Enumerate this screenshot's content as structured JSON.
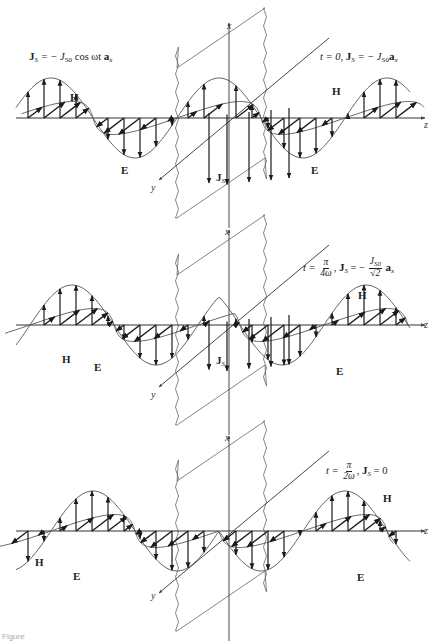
{
  "figure": {
    "colors": {
      "ink": "#1a1a1a",
      "envelope": "#555555",
      "sheet": "#666666",
      "background": "#ffffff"
    },
    "panels": [
      {
        "id": "t0",
        "axis_y": 118,
        "phase_deg": 0,
        "source_label": {
          "bold_sym": "J",
          "sub": "S",
          "rest": " = − J",
          "sub2": "S0",
          "rest2": " cos ωt ",
          "bold_tail": "a",
          "tail_sub": "x"
        },
        "time_label": {
          "t": "t = 0,",
          "bold_sym": "J",
          "sub": "S",
          "rest": " = − J",
          "sub2": "S0",
          "bold_tail": "a",
          "tail_sub": "x"
        },
        "field_labels": {
          "H": "H",
          "E": "E",
          "Js": "J",
          "Js_sub": "S"
        },
        "axis_labels": {
          "x": "x",
          "y": "y",
          "z": "z"
        }
      },
      {
        "id": "t_pi_4w",
        "axis_y": 325,
        "phase_deg": 45,
        "time_label": {
          "t": "t =",
          "frac_num": "π",
          "frac_den": "4ω",
          "bold_sym": "J",
          "sub": "S",
          "rest": " = −",
          "frac2_num": "J",
          "frac2_num_sub": "S0",
          "frac2_den": "√2",
          "bold_tail": "a",
          "tail_sub": "x"
        },
        "field_labels": {
          "H_left": "H",
          "E_left": "E",
          "H_right": "H",
          "E_right": "E",
          "Js": "J",
          "Js_sub": "S"
        },
        "axis_labels": {
          "x": "x",
          "y": "y",
          "z": "z"
        }
      },
      {
        "id": "t_pi_2w",
        "axis_y": 531,
        "phase_deg": 90,
        "time_label": {
          "t": "t =",
          "frac_num": "π",
          "frac_den": "2ω",
          "bold_sym": "J",
          "sub": "S",
          "rest": " = 0"
        },
        "field_labels": {
          "H_left": "H",
          "E_left": "E",
          "H_right": "H",
          "E_right": "E"
        },
        "axis_labels": {
          "x": "x",
          "y": "y",
          "z": "z"
        }
      }
    ],
    "caption": "Figure"
  }
}
